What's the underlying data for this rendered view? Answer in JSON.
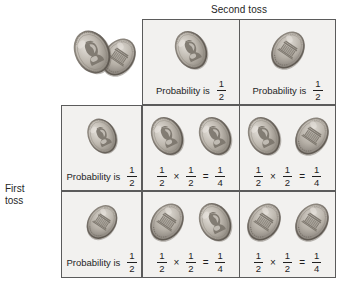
{
  "figure": {
    "column_header": "Second toss",
    "row_header_lines": [
      "First",
      "toss"
    ],
    "illustration_name": "two-pennies-heads-and-tails"
  },
  "labels": {
    "probability_is": "Probability is",
    "times": "×",
    "equals": "="
  },
  "fractions": {
    "half": {
      "numerator": "1",
      "denominator": "2"
    },
    "quarter": {
      "numerator": "1",
      "denominator": "4"
    }
  },
  "grid": {
    "header_row": {
      "heads_cell": {
        "coins": [
          "heads"
        ],
        "caption": "Probability is",
        "probability": {
          "numerator": "1",
          "denominator": "2"
        }
      },
      "tails_cell": {
        "coins": [
          "tails"
        ],
        "caption": "Probability is",
        "probability": {
          "numerator": "1",
          "denominator": "2"
        }
      }
    },
    "rows": [
      {
        "header_cell": {
          "coins": [
            "heads"
          ],
          "caption": "Probability is",
          "probability": {
            "numerator": "1",
            "denominator": "2"
          }
        },
        "cells": [
          {
            "coins": [
              "heads",
              "heads"
            ],
            "left": {
              "numerator": "1",
              "denominator": "2"
            },
            "right": {
              "numerator": "1",
              "denominator": "2"
            },
            "result": {
              "numerator": "1",
              "denominator": "4"
            }
          },
          {
            "coins": [
              "heads",
              "tails"
            ],
            "left": {
              "numerator": "1",
              "denominator": "2"
            },
            "right": {
              "numerator": "1",
              "denominator": "2"
            },
            "result": {
              "numerator": "1",
              "denominator": "4"
            }
          }
        ]
      },
      {
        "header_cell": {
          "coins": [
            "tails"
          ],
          "caption": "Probability is",
          "probability": {
            "numerator": "1",
            "denominator": "2"
          }
        },
        "cells": [
          {
            "coins": [
              "tails",
              "heads"
            ],
            "left": {
              "numerator": "1",
              "denominator": "2"
            },
            "right": {
              "numerator": "1",
              "denominator": "2"
            },
            "result": {
              "numerator": "1",
              "denominator": "4"
            }
          },
          {
            "coins": [
              "tails",
              "tails"
            ],
            "left": {
              "numerator": "1",
              "denominator": "2"
            },
            "right": {
              "numerator": "1",
              "denominator": "2"
            },
            "result": {
              "numerator": "1",
              "denominator": "4"
            }
          }
        ]
      }
    ]
  },
  "colors": {
    "cell_background": "#f2f1ef",
    "border": "#5b5b5b",
    "text": "#1f1f1f",
    "coin_light": "#cfcac2",
    "coin_mid": "#a9a39a",
    "coin_dark": "#7e786f",
    "page_background": "#ffffff"
  }
}
